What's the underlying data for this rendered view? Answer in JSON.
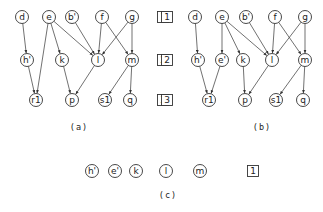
{
  "panels": [
    {
      "id": "a",
      "caption": "(a)",
      "levels": [
        "1",
        "2",
        "3"
      ],
      "nodes": [
        {
          "id": "d",
          "label": "d",
          "level": 1
        },
        {
          "id": "e",
          "label": "e",
          "level": 1
        },
        {
          "id": "b'",
          "label": "b'",
          "level": 1
        },
        {
          "id": "f",
          "label": "f",
          "level": 1
        },
        {
          "id": "g",
          "label": "g",
          "level": 1
        },
        {
          "id": "h'",
          "label": "h'",
          "level": 2
        },
        {
          "id": "k",
          "label": "k",
          "level": 2
        },
        {
          "id": "l",
          "label": "l",
          "level": 2
        },
        {
          "id": "m",
          "label": "m",
          "level": 2
        },
        {
          "id": "r1",
          "label": "r1",
          "level": 3
        },
        {
          "id": "p",
          "label": "p",
          "level": 3
        },
        {
          "id": "s1",
          "label": "s1",
          "level": 3
        },
        {
          "id": "q",
          "label": "q",
          "level": 3
        }
      ],
      "edges": [
        [
          "d",
          "h'"
        ],
        [
          "e",
          "r1"
        ],
        [
          "e",
          "k"
        ],
        [
          "e",
          "l"
        ],
        [
          "b'",
          "l"
        ],
        [
          "f",
          "l"
        ],
        [
          "f",
          "m"
        ],
        [
          "g",
          "l"
        ],
        [
          "g",
          "m"
        ],
        [
          "h'",
          "r1"
        ],
        [
          "k",
          "p"
        ],
        [
          "l",
          "p"
        ],
        [
          "m",
          "s1"
        ],
        [
          "m",
          "q"
        ]
      ]
    },
    {
      "id": "b",
      "caption": "(b)",
      "levels": [
        "1",
        "2",
        "3"
      ],
      "nodes": [
        {
          "id": "d",
          "label": "d",
          "level": 1
        },
        {
          "id": "e",
          "label": "e",
          "level": 1
        },
        {
          "id": "b'",
          "label": "b'",
          "level": 1
        },
        {
          "id": "f",
          "label": "f",
          "level": 1
        },
        {
          "id": "g",
          "label": "g",
          "level": 1
        },
        {
          "id": "h'",
          "label": "h'",
          "level": 2
        },
        {
          "id": "e'",
          "label": "e'",
          "level": 2
        },
        {
          "id": "k",
          "label": "k",
          "level": 2
        },
        {
          "id": "l",
          "label": "l",
          "level": 2
        },
        {
          "id": "m",
          "label": "m",
          "level": 2
        },
        {
          "id": "r1",
          "label": "r1",
          "level": 3
        },
        {
          "id": "p",
          "label": "p",
          "level": 3
        },
        {
          "id": "s1",
          "label": "s1",
          "level": 3
        },
        {
          "id": "q",
          "label": "q",
          "level": 3
        }
      ],
      "edges": [
        [
          "d",
          "h'"
        ],
        [
          "e",
          "e'"
        ],
        [
          "e",
          "k"
        ],
        [
          "e",
          "l"
        ],
        [
          "b'",
          "l"
        ],
        [
          "f",
          "l"
        ],
        [
          "f",
          "m"
        ],
        [
          "g",
          "l"
        ],
        [
          "g",
          "m"
        ],
        [
          "h'",
          "r1"
        ],
        [
          "e'",
          "r1"
        ],
        [
          "k",
          "p"
        ],
        [
          "l",
          "p"
        ],
        [
          "m",
          "s1"
        ],
        [
          "m",
          "q"
        ]
      ]
    },
    {
      "id": "c",
      "caption": "(c)",
      "levels": [
        "1"
      ],
      "nodes": [
        {
          "id": "h'",
          "label": "h'",
          "level": 1
        },
        {
          "id": "e'",
          "label": "e'",
          "level": 1
        },
        {
          "id": "k",
          "label": "k",
          "level": 1
        },
        {
          "id": "l",
          "label": "l",
          "level": 1
        },
        {
          "id": "m",
          "label": "m",
          "level": 1
        }
      ],
      "edges": []
    }
  ]
}
